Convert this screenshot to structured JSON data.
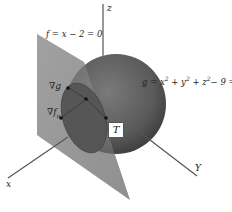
{
  "figure": {
    "plane": {
      "equation": "f = x − 2 = 0",
      "color": "#8f8f8f"
    },
    "sphere": {
      "equation_prefix": "g = x",
      "equation_parts": [
        "g = x",
        "2",
        " + y",
        "2",
        " + z",
        "2",
        "− 9 = 0"
      ],
      "color": "#5c5c5c"
    },
    "axes": {
      "x": "x",
      "y": "Y",
      "z": "z"
    },
    "gradients": {
      "grad_g": {
        "symbol": "∇",
        "var": "g"
      },
      "grad_f": {
        "symbol": "∇",
        "var": "f",
        "subscript": "o"
      }
    },
    "tangent_label": "T"
  }
}
